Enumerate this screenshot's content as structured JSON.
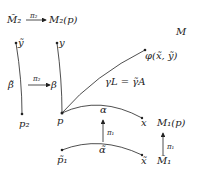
{
  "labels": {
    "M2_tilde": "M̃₂",
    "pi2_top": "π₂",
    "M2p": "M₂(p)",
    "M": "M",
    "y_tilde": "ỹ",
    "y": "y",
    "phi": "φ(x̃, ỹ)",
    "beta_tilde": "β̃",
    "pi2_mid": "π₂",
    "beta": "β",
    "gamma": "γL = γ̃A",
    "alpha_top": "α",
    "p2": "p₂",
    "p": "p",
    "x": "x",
    "M1p": "M₁(p)",
    "pi1_mid": "π₁",
    "pi1_right": "π₁",
    "p1_tilde": "p̃₁",
    "alpha_tilde": "α̃",
    "x_tilde": "x̃",
    "M1_tilde": "M̃₁"
  },
  "colors": {
    "ink": "#222222",
    "background": "#ffffff"
  }
}
